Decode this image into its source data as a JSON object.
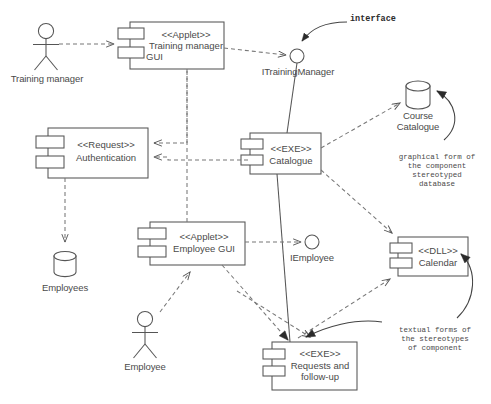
{
  "diagram": {
    "type": "uml-component-diagram",
    "stroke_color": "#555555",
    "text_color": "#4a4a4a",
    "background": "#ffffff",
    "components": [
      {
        "id": "training-manager-gui",
        "stereotype": "<<Applet>>",
        "name_line1": "Training manager",
        "name_line2": "GUI"
      },
      {
        "id": "authentication",
        "stereotype": "<<Request>>",
        "name_line1": "Authentication",
        "name_line2": ""
      },
      {
        "id": "catalogue",
        "stereotype": "<<EXE>>",
        "name_line1": "Catalogue",
        "name_line2": ""
      },
      {
        "id": "employee-gui",
        "stereotype": "<<Applet>>",
        "name_line1": "Employee GUI",
        "name_line2": ""
      },
      {
        "id": "calendar",
        "stereotype": "<<DLL>>",
        "name_line1": "Calendar",
        "name_line2": ""
      },
      {
        "id": "requests-follow-up",
        "stereotype": "<<EXE>>",
        "name_line1": "Requests and",
        "name_line2": "follow-up"
      }
    ],
    "actors": [
      {
        "id": "training-manager-actor",
        "label": "Training manager"
      },
      {
        "id": "employee-actor",
        "label": "Employee"
      }
    ],
    "databases": [
      {
        "id": "course-catalogue-db",
        "label_line1": "Course",
        "label_line2": "Catalogue"
      },
      {
        "id": "employees-db",
        "label_line1": "Employees",
        "label_line2": ""
      }
    ],
    "interfaces": [
      {
        "id": "itrainingmanager",
        "label": "ITrainingManager"
      },
      {
        "id": "iemployee",
        "label": "IEmployee"
      }
    ],
    "annotations": [
      {
        "id": "interface-callout",
        "text": "interface",
        "style": "bold-monospace"
      },
      {
        "id": "database-stereotype-note",
        "line1": "graphical form of",
        "line2": "the component",
        "line3": "stereotyped",
        "line4": "database"
      },
      {
        "id": "textual-stereotype-note",
        "line1": "textual forms of",
        "line2": "the stereotypes",
        "line3": "of component",
        "line4": ""
      }
    ]
  }
}
